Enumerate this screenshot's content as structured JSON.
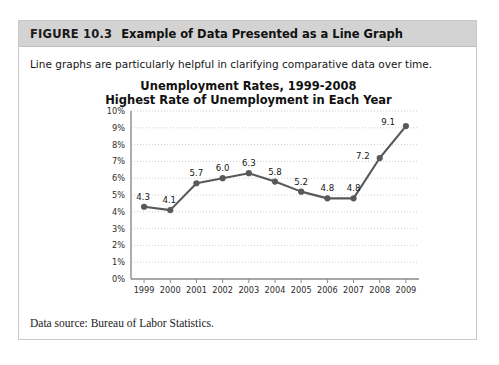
{
  "figure": {
    "label": "FIGURE 10.3",
    "title": "Example of Data Presented as a Line Graph",
    "intro": "Line graphs are particularly helpful in clarifying comparative data over time.",
    "source_note": "Data source: Bureau of Labor Statistics."
  },
  "chart_data": {
    "type": "line",
    "title": "Unemployment Rates, 1999-2008",
    "subtitle": "Highest Rate of Unemployment in Each Year",
    "xlabel": "",
    "ylabel": "",
    "categories": [
      "1999",
      "2000",
      "2001",
      "2002",
      "2003",
      "2004",
      "2005",
      "2006",
      "2007",
      "2008",
      "2009"
    ],
    "values": [
      4.3,
      4.1,
      5.7,
      6.0,
      6.3,
      5.8,
      5.2,
      4.8,
      4.8,
      7.2,
      9.1
    ],
    "point_labels": [
      "4.3",
      "4.1",
      "5.7",
      "6.0",
      "6.3",
      "5.8",
      "5.2",
      "4.8",
      "4.8",
      "7.2",
      "9.1"
    ],
    "ylim": [
      0,
      10
    ],
    "ytick_labels": [
      "10%",
      "9%",
      "8%",
      "7%",
      "6%",
      "5%",
      "4%",
      "3%",
      "2%",
      "1%",
      "0%"
    ],
    "ytick_values": [
      10,
      9,
      8,
      7,
      6,
      5,
      4,
      3,
      2,
      1,
      0
    ],
    "grid": true,
    "legend": false,
    "series_color": "#595959",
    "grid_color": "#cfcfcf",
    "axis_color": "#8c8c8c"
  },
  "colors": {
    "header_band": "#d3d3d3",
    "card_border": "#c9c9c9",
    "text": "#111111"
  }
}
